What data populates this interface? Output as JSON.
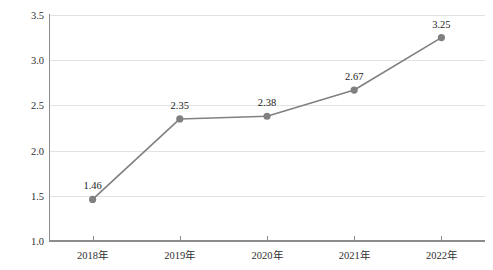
{
  "chart_data": {
    "type": "line",
    "title": "",
    "xlabel": "",
    "ylabel": "比例 / %",
    "categories": [
      "2018年",
      "2019年",
      "2020年",
      "2021年",
      "2022年"
    ],
    "values": [
      1.46,
      2.35,
      2.38,
      2.67,
      3.25
    ],
    "point_labels": [
      "1.46",
      "2.35",
      "2.38",
      "2.67",
      "3.25"
    ],
    "ylim": [
      1.0,
      3.5
    ],
    "yticks": [
      1.0,
      1.5,
      2.0,
      2.5,
      3.0,
      3.5
    ],
    "ytick_labels": [
      "1.0",
      "1.5",
      "2.0",
      "2.5",
      "3.0",
      "3.5"
    ],
    "grid": true,
    "legend": "none",
    "series": [
      {
        "name": "比例",
        "values": [
          1.46,
          2.35,
          2.38,
          2.67,
          3.25
        ],
        "color": "#808080",
        "marker": "circle"
      }
    ],
    "colors": {
      "line": "#808080",
      "marker": "#808080",
      "grid": "#e2e2e2",
      "axis": "#8c8c8c",
      "text": "#2f2f2f",
      "background": "#ffffff"
    }
  }
}
